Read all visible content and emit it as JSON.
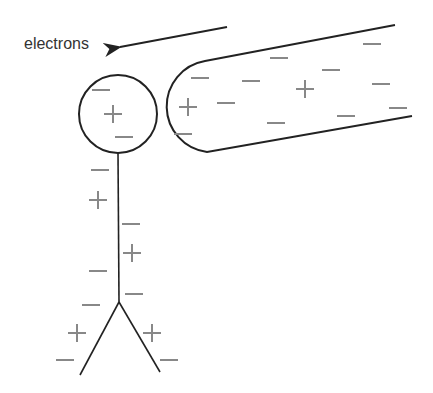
{
  "diagram": {
    "label_electrons": "electrons",
    "colors": {
      "outline": "#222222",
      "charge": "#888888",
      "text": "#333333"
    },
    "sphere_charges": [
      {
        "sign": "-",
        "x": 101,
        "y": 90
      },
      {
        "sign": "+",
        "x": 113,
        "y": 114
      },
      {
        "sign": "-",
        "x": 124,
        "y": 137
      }
    ],
    "rod_charges": [
      {
        "sign": "-",
        "x": 200,
        "y": 78
      },
      {
        "sign": "+",
        "x": 188,
        "y": 107
      },
      {
        "sign": "-",
        "x": 226,
        "y": 103
      },
      {
        "sign": "-",
        "x": 183,
        "y": 134
      },
      {
        "sign": "-",
        "x": 279,
        "y": 58
      },
      {
        "sign": "-",
        "x": 251,
        "y": 81
      },
      {
        "sign": "+",
        "x": 305,
        "y": 89
      },
      {
        "sign": "-",
        "x": 331,
        "y": 70
      },
      {
        "sign": "-",
        "x": 372,
        "y": 44
      },
      {
        "sign": "-",
        "x": 381,
        "y": 84
      },
      {
        "sign": "-",
        "x": 346,
        "y": 116
      },
      {
        "sign": "-",
        "x": 276,
        "y": 123
      },
      {
        "sign": "-",
        "x": 398,
        "y": 108
      }
    ],
    "stem_charges": [
      {
        "sign": "-",
        "x": 100,
        "y": 170
      },
      {
        "sign": "+",
        "x": 98,
        "y": 200
      },
      {
        "sign": "-",
        "x": 131,
        "y": 224
      },
      {
        "sign": "+",
        "x": 132,
        "y": 253
      },
      {
        "sign": "-",
        "x": 98,
        "y": 271
      },
      {
        "sign": "-",
        "x": 134,
        "y": 294
      },
      {
        "sign": "-",
        "x": 91,
        "y": 305
      },
      {
        "sign": "+",
        "x": 77,
        "y": 333
      },
      {
        "sign": "+",
        "x": 152,
        "y": 333
      },
      {
        "sign": "-",
        "x": 65,
        "y": 360
      },
      {
        "sign": "-",
        "x": 169,
        "y": 360
      }
    ]
  }
}
